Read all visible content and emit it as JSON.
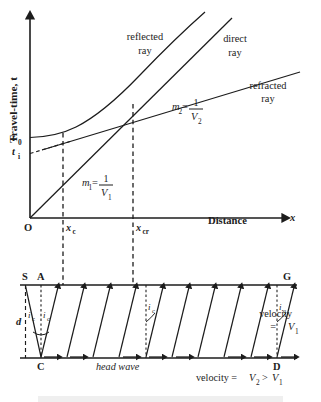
{
  "figure": {
    "stroke_color": "#1c1c1c",
    "background": "#ffffff"
  },
  "graph": {
    "y_axis_label": "Travel-time, t",
    "y_axis_symbol": "t",
    "x_axis_label": "Distance",
    "x_axis_symbol": "x",
    "origin_label": "O",
    "y_ticks": [
      {
        "id": "t0",
        "base": "t",
        "sub": "0"
      },
      {
        "id": "ti",
        "base": "t",
        "sub": "i"
      }
    ],
    "x_ticks": [
      {
        "id": "xc",
        "base": "x",
        "sub": "c"
      },
      {
        "id": "xcr",
        "base": "x",
        "sub": "cr"
      }
    ],
    "curve_labels": [
      {
        "id": "reflected",
        "line1": "reflected",
        "line2": "ray"
      },
      {
        "id": "direct",
        "line1": "direct",
        "line2": "ray"
      },
      {
        "id": "refracted",
        "line1": "refracted",
        "line2": "ray"
      }
    ],
    "slope_annotations": [
      {
        "id": "m1",
        "m_base": "m",
        "m_sub": "1",
        "equals": "=",
        "numerator": "1",
        "denom_base": "V",
        "denom_sub": "1"
      },
      {
        "id": "m2",
        "m_base": "m",
        "m_sub": "2",
        "equals": "=",
        "numerator": "1",
        "denom_base": "V",
        "denom_sub": "2"
      }
    ]
  },
  "raydiagram": {
    "points": [
      {
        "id": "S",
        "label": "S"
      },
      {
        "id": "A",
        "label": "A"
      },
      {
        "id": "G",
        "label": "G"
      },
      {
        "id": "C",
        "label": "C"
      },
      {
        "id": "D",
        "label": "D"
      }
    ],
    "depth_label": "d",
    "angle_label_base": "i",
    "angle_label_sub": "c",
    "head_wave_label": "head wave",
    "velocity_upper": {
      "line1": "velocity",
      "line2_eq": "=",
      "line2_base": "V",
      "line2_sub": "1"
    },
    "velocity_lower": {
      "prefix": "velocity =",
      "v2_base": "V",
      "v2_sub": "2",
      "relation": ">",
      "v1_base": "V",
      "v1_sub": "1"
    }
  }
}
